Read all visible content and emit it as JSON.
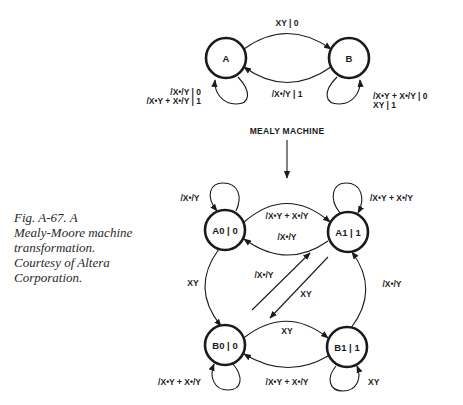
{
  "caption": {
    "lines": [
      "Fig. A-67. A",
      "Mealy-Moore machine",
      "transformation.",
      "Courtesy of Altera",
      "Corporation."
    ]
  },
  "mealy": {
    "title": "MEALY MACHINE",
    "states": [
      {
        "id": "A",
        "label": "A"
      },
      {
        "id": "B",
        "label": "B"
      }
    ],
    "transitions": {
      "a_to_b": "XY | 0",
      "b_to_a": "/X•/Y | 1",
      "a_self_1": "/X•/Y | 0",
      "a_self_2": "/X•Y + X•/Y | 1",
      "b_self_1": "/X•Y + X•/Y | 0",
      "b_self_2": "XY | 1"
    }
  },
  "moore": {
    "states": [
      {
        "id": "A0",
        "label": "A0 | 0"
      },
      {
        "id": "A1",
        "label": "A1 | 1"
      },
      {
        "id": "B0",
        "label": "B0 | 0"
      },
      {
        "id": "B1",
        "label": "B1 | 1"
      }
    ],
    "transitions": {
      "a0_self": "/X•/Y",
      "a1_self": "/X•Y + X•/Y",
      "a0_to_a1": "/X•Y + X•/Y",
      "a1_to_a0": "/X•/Y",
      "a0_to_b0": "XY",
      "b1_to_a1": "/X•/Y",
      "b0_to_a1": "/X•/Y",
      "a1_to_b0": "XY",
      "b0_to_b1": "XY",
      "b1_to_b0": "/X•Y + X•/Y",
      "b0_self": "/X•Y + X•/Y",
      "b1_self": "XY"
    }
  }
}
